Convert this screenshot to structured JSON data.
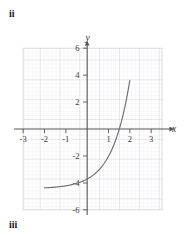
{
  "figure": {
    "part_label_top": "ii",
    "part_label_bottom": "iii"
  },
  "colors": {
    "minor_grid": "#e2e2e8",
    "major_grid": "#c9c9d2",
    "axis": "#555555",
    "curve": "#6e6e6e",
    "text": "#2a2a2a",
    "background": "#ffffff"
  },
  "chart_data": {
    "type": "line",
    "title": "",
    "xlabel": "x",
    "ylabel": "y",
    "xlim": [
      -3,
      3
    ],
    "ylim": [
      -6,
      6
    ],
    "x_ticks": [
      -3,
      -2,
      -1,
      1,
      2,
      3
    ],
    "y_ticks": [
      -6,
      -4,
      -2,
      2,
      4,
      6
    ],
    "x_tick_labels": [
      "-3",
      "-2",
      "-1",
      "1",
      "2",
      "3"
    ],
    "y_tick_labels": [
      "-6",
      "-4",
      "-2",
      "2",
      "4",
      "6"
    ],
    "grid": true,
    "minor_grid": true,
    "minor_grid_step": 0.2,
    "major_grid_step": 1,
    "legend": "none",
    "series": [
      {
        "name": "exponential-curve",
        "x": [
          -2.0,
          -1.8,
          -1.6,
          -1.4,
          -1.2,
          -1.0,
          -0.8,
          -0.6,
          -0.4,
          -0.2,
          0.0,
          0.2,
          0.4,
          0.6,
          0.8,
          1.0,
          1.2,
          1.4,
          1.6,
          1.8,
          2.0
        ],
        "y": [
          -4.16,
          -4.11,
          -4.05,
          -3.98,
          -3.89,
          -3.78,
          -3.64,
          -3.47,
          -3.26,
          -3.0,
          -2.68,
          -2.29,
          -1.8,
          -1.2,
          -0.45,
          0.48,
          1.63,
          3.06,
          4.84,
          4.84,
          4.84
        ]
      }
    ]
  },
  "axis_arrows": {
    "x_positive": true,
    "y_positive": true
  }
}
